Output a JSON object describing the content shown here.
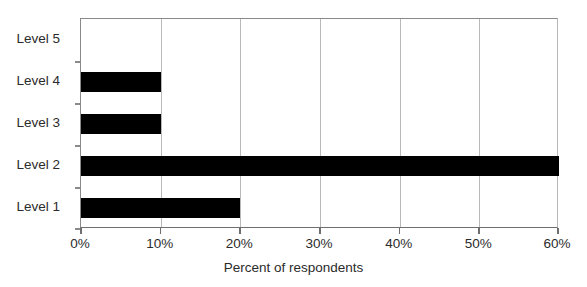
{
  "chart_data": {
    "type": "bar",
    "orientation": "horizontal",
    "title": "",
    "xlabel": "Percent of respondents",
    "ylabel": "",
    "categories": [
      "Level 1",
      "Level 2",
      "Level 3",
      "Level 4",
      "Level 5"
    ],
    "values": [
      20,
      60,
      10,
      10,
      0
    ],
    "unit": "%",
    "xlim": [
      0,
      60
    ],
    "xticks": [
      0,
      10,
      20,
      30,
      40,
      50,
      60
    ],
    "xticklabels": [
      "0%",
      "10%",
      "20%",
      "30%",
      "40%",
      "50%",
      "60%"
    ],
    "grid": "vertical",
    "legend": "none",
    "bar_color": "#000000",
    "gridline_color": "#b9b9b9",
    "axis_color": "#6f6f6f",
    "background": "#ffffff",
    "category_order_top_to_bottom": [
      "Level 5",
      "Level 4",
      "Level 3",
      "Level 2",
      "Level 1"
    ]
  }
}
